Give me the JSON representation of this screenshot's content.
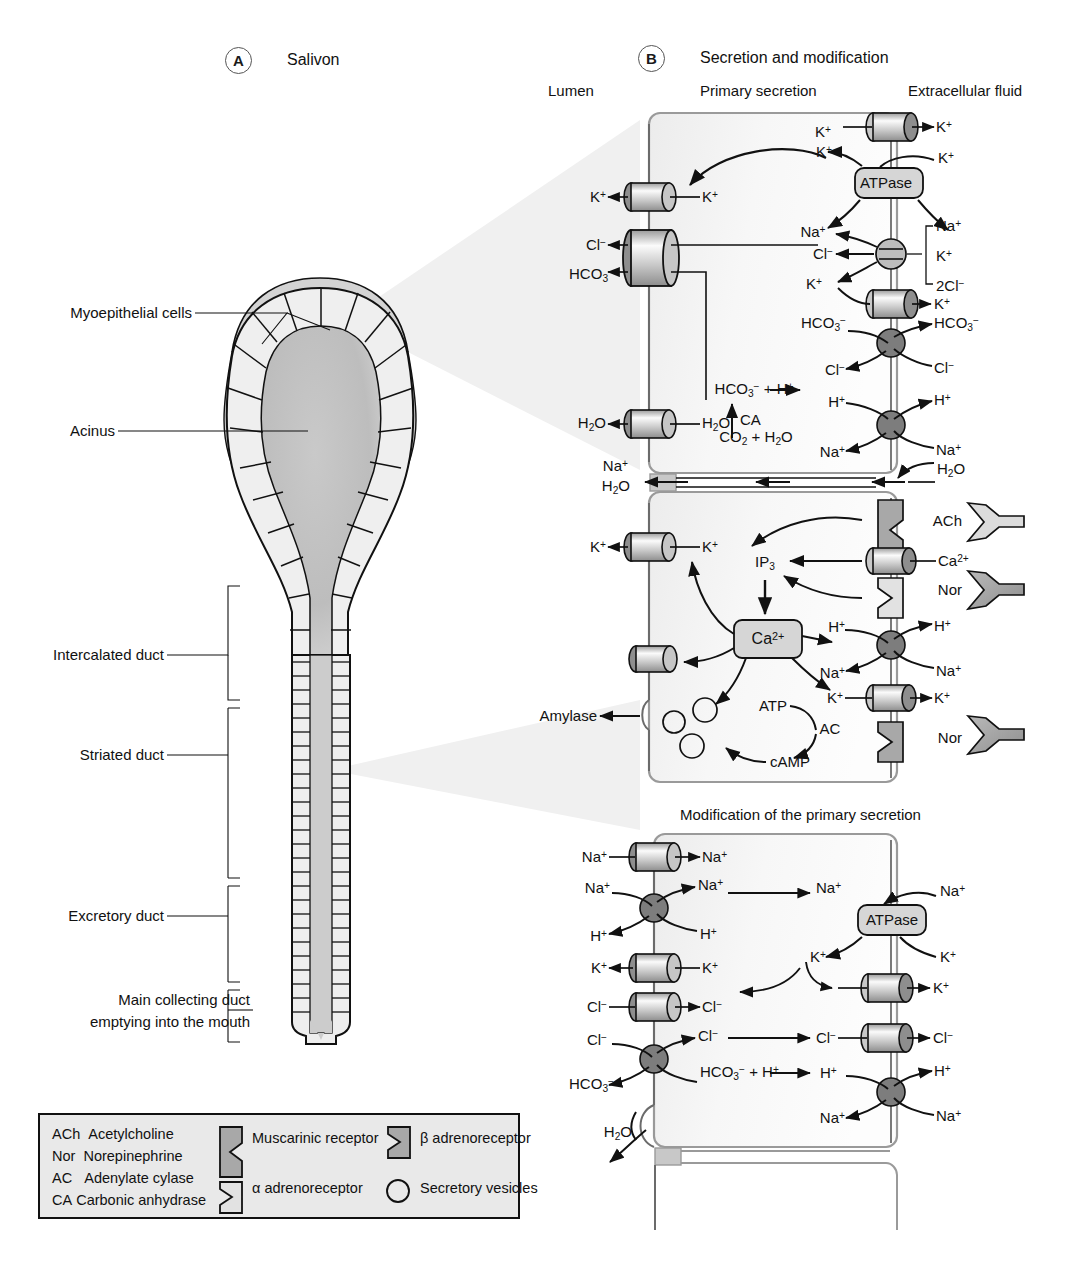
{
  "figure": {
    "panel_a": {
      "letter": "A",
      "title": "Salivon"
    },
    "panel_b": {
      "letter": "B",
      "title": "Secretion and modification"
    }
  },
  "salivon": {
    "labels": [
      {
        "text": "Myoepithelial cells",
        "kind": "leader"
      },
      {
        "text": "Acinus",
        "kind": "leader"
      },
      {
        "text": "Intercalated duct",
        "kind": "bracket"
      },
      {
        "text": "Striated duct",
        "kind": "bracket"
      },
      {
        "text": "Excretory duct",
        "kind": "bracket"
      },
      {
        "text": "Main collecting duct",
        "kind": "bracket"
      },
      {
        "text": "emptying into the mouth",
        "kind": "bracket-line2"
      }
    ]
  },
  "panel_b": {
    "column_headers": {
      "lumen": "Lumen",
      "primary_secretion": "Primary secretion",
      "extracellular_fluid": "Extracellular fluid"
    },
    "cell3_title": "Modification of the primary secretion",
    "cell1": {
      "name": "acinar-cell-primary-secretion",
      "apical_labels": [
        "K+",
        "Cl−",
        "HCO3−",
        "H2O",
        "Na+",
        "H2O"
      ],
      "cytosol_labels": [
        "K+",
        "K+",
        "Cl−",
        "K+",
        "HCO3−",
        "Cl−",
        "H+",
        "Na+",
        "HCO3− + H+",
        "CA",
        "CO2 + H2O",
        "K+"
      ],
      "basolateral_labels": [
        "K+",
        "K+",
        "Na+",
        "K+",
        "2Cl−",
        "K+",
        "HCO3−",
        "Cl−",
        "H+",
        "Na+",
        "H2O"
      ],
      "pump": "ATPase",
      "nkcc_bracket": [
        "Na+",
        "K+",
        "2Cl−"
      ]
    },
    "cell2": {
      "name": "acinar-cell-signalling",
      "messengers": {
        "ip3": "IP3",
        "calcium": "Ca2+",
        "atp": "ATP",
        "camp": "cAMP",
        "ac": "AC"
      },
      "secretion_label": "Amylase",
      "apical_labels": [
        "K+"
      ],
      "basolateral_labels": [
        "ACh",
        "Ca2+",
        "Nor",
        "H+",
        "Na+",
        "K+",
        "Nor"
      ],
      "cytosol_labels": [
        "K+",
        "H+",
        "Na+",
        "K+"
      ]
    },
    "cell3": {
      "name": "duct-cell-modification",
      "pump": "ATPase",
      "apical_labels": [
        "Na+",
        "Na+",
        "H+",
        "K+",
        "Cl−",
        "Cl−",
        "HCO3−",
        "H2O"
      ],
      "cytosol_labels": [
        "Na+",
        "Na+",
        "H+",
        "K+",
        "Cl−",
        "Cl−",
        "Na+",
        "K+",
        "Cl−",
        "H+",
        "HCO3− + H+"
      ],
      "basolateral_labels": [
        "Na+",
        "K+",
        "K+",
        "Cl−",
        "H+",
        "Na+"
      ]
    }
  },
  "legend": {
    "abbreviations": [
      {
        "abbr": "ACh",
        "term": "Acetylcholine"
      },
      {
        "abbr": "Nor",
        "term": "Norepinephrine"
      },
      {
        "abbr": "AC",
        "term": "Adenylate cylase"
      },
      {
        "abbr": "CA",
        "term": "Carbonic anhydrase"
      }
    ],
    "symbols": [
      {
        "glyph": "muscarinic-receptor",
        "label": "Muscarinic receptor"
      },
      {
        "glyph": "alpha-adrenoreceptor",
        "label": "α adrenoreceptor"
      },
      {
        "glyph": "beta-adrenoreceptor",
        "label": "β adrenoreceptor"
      },
      {
        "glyph": "secretory-vesicle",
        "label": "Secretory vesicles"
      }
    ]
  },
  "colors": {
    "outline": "#111111",
    "cell_fill_light": "#f4f4f4",
    "cell_fill_mid": "#e3e3e3",
    "channel_dark": "#8a8a8a",
    "box_fill": "#d9d9d9",
    "lumen_gray": "#b5b5b5"
  }
}
